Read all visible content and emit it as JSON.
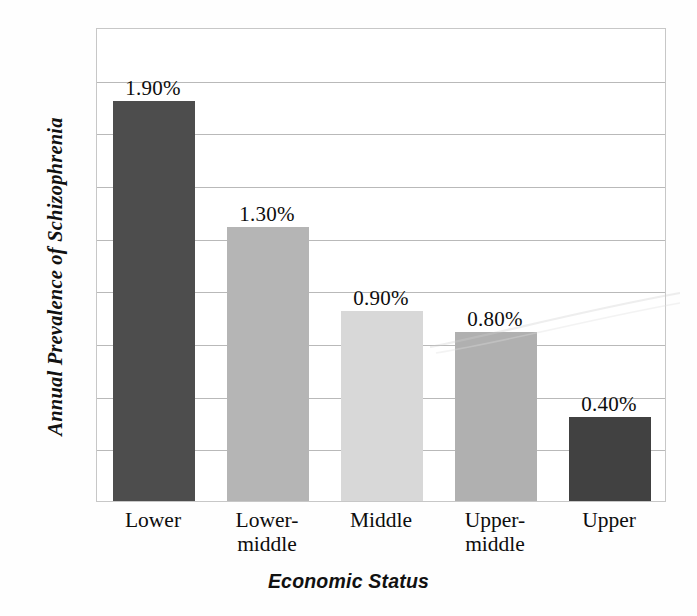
{
  "chart_data": {
    "type": "bar",
    "title": "",
    "xlabel": "Economic Status",
    "ylabel": "Annual Prevalence of Schizophrenia",
    "categories": [
      "Lower",
      "Lower-\nmiddle",
      "Middle",
      "Upper-\nmiddle",
      "Upper"
    ],
    "values": [
      1.9,
      1.3,
      0.9,
      0.8,
      0.4
    ],
    "data_labels": [
      "1.90%",
      "1.30%",
      "0.90%",
      "0.80%",
      "0.40%"
    ],
    "ylim": [
      0,
      2.25
    ],
    "y_gridline_count": 8,
    "grid": true,
    "legend": false,
    "bar_colors": [
      "#4d4d4d",
      "#b5b5b5",
      "#d8d8d8",
      "#b0b0b0",
      "#414141"
    ],
    "gridline_color": "#b9b9b9",
    "frame_color": "#c7c7c7",
    "background_color": "#ffffff",
    "text_color": "#0d0d0d"
  },
  "axes": {
    "y_title": "Annual Prevalence of Schizophrenia",
    "x_title": "Economic Status"
  },
  "bars": [
    {
      "category": "Lower",
      "label": "1.90%",
      "value": 1.9,
      "color": "#4d4d4d"
    },
    {
      "category": "Lower-\nmiddle",
      "label": "1.30%",
      "value": 1.3,
      "color": "#b5b5b5"
    },
    {
      "category": "Middle",
      "label": "0.90%",
      "value": 0.9,
      "color": "#d8d8d8"
    },
    {
      "category": "Upper-\nmiddle",
      "label": "0.80%",
      "value": 0.8,
      "color": "#b0b0b0"
    },
    {
      "category": "Upper",
      "label": "0.40%",
      "value": 0.4,
      "color": "#414141"
    }
  ]
}
